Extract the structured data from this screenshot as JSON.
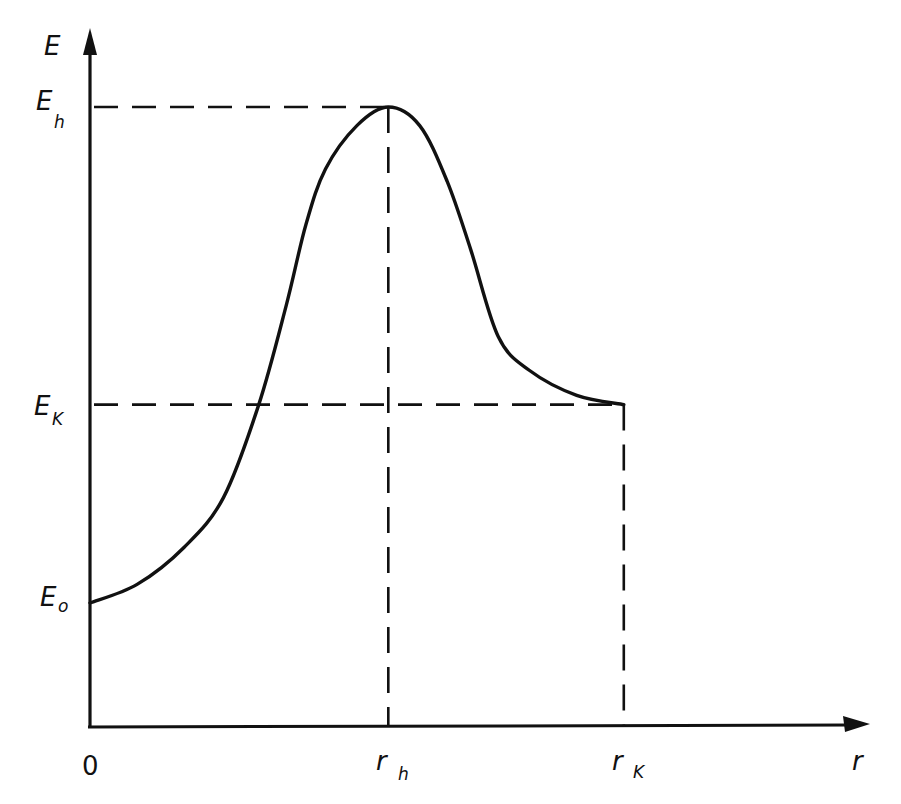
{
  "diagram": {
    "kind": "energy-vs-distance curve (hand-drawn)",
    "ink_color": "#111111",
    "background": "#ffffff",
    "axes": {
      "y_axis_label": "E",
      "x_axis_label": "r",
      "origin_label": "0"
    },
    "y_marks": [
      {
        "id": "Eh",
        "base": "E",
        "sub": "h",
        "value": 1.0
      },
      {
        "id": "EK",
        "base": "E",
        "sub": "K",
        "value": 0.52
      },
      {
        "id": "E0",
        "base": "E",
        "sub": "o",
        "value": 0.2
      }
    ],
    "x_marks": [
      {
        "id": "rh",
        "base": "r",
        "sub": "h",
        "value": 0.38
      },
      {
        "id": "rK",
        "base": "r",
        "sub": "K",
        "value": 0.68
      }
    ],
    "curve": {
      "description": "Starts at E0 on the E axis, rises to maximum Eh at rh, then decreases to EK at rK",
      "points": [
        [
          0.0,
          0.2
        ],
        [
          0.06,
          0.23
        ],
        [
          0.12,
          0.29
        ],
        [
          0.17,
          0.37
        ],
        [
          0.215,
          0.52
        ],
        [
          0.25,
          0.68
        ],
        [
          0.275,
          0.81
        ],
        [
          0.3,
          0.9
        ],
        [
          0.34,
          0.97
        ],
        [
          0.38,
          1.0
        ],
        [
          0.42,
          0.97
        ],
        [
          0.455,
          0.88
        ],
        [
          0.485,
          0.77
        ],
        [
          0.52,
          0.63
        ],
        [
          0.56,
          0.575
        ],
        [
          0.62,
          0.535
        ],
        [
          0.68,
          0.52
        ]
      ]
    },
    "guides": [
      {
        "from": "Eh",
        "to": "rh",
        "style": "dashed"
      },
      {
        "from": "EK",
        "to": "rK",
        "style": "dashed"
      }
    ]
  }
}
